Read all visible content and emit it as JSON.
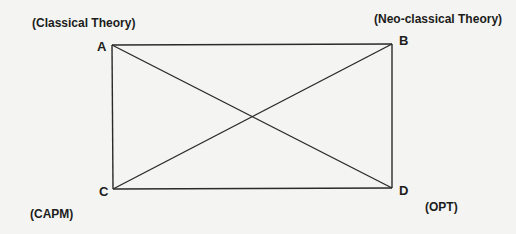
{
  "diagram": {
    "type": "rectangle-with-diagonals",
    "line_color": "#2a2a2a",
    "background": "#f4f4f2",
    "corners": {
      "A": {
        "label": "A",
        "theory": "(Classical Theory)",
        "x": 112,
        "y": 45
      },
      "B": {
        "label": "B",
        "theory": "(Neo-classical Theory)",
        "x": 392,
        "y": 44
      },
      "C": {
        "label": "C",
        "theory": "(CAPM)",
        "x": 113,
        "y": 189
      },
      "D": {
        "label": "D",
        "theory": "(OPT)",
        "x": 392,
        "y": 188
      }
    },
    "edges": [
      [
        "A",
        "B"
      ],
      [
        "B",
        "D"
      ],
      [
        "D",
        "C"
      ],
      [
        "C",
        "A"
      ],
      [
        "A",
        "D"
      ],
      [
        "B",
        "C"
      ]
    ]
  }
}
